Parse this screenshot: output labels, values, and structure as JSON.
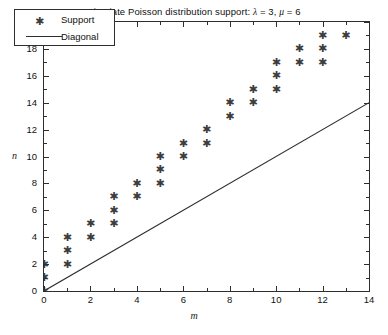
{
  "chart_data": {
    "type": "scatter",
    "title": "Bivariate Poisson distribution support: λ = 3, μ = 6",
    "title_parts": {
      "prefix": "Bivariate Poisson distribution support: ",
      "lambda_symbol": "λ",
      "lambda_eq": " = 3, ",
      "mu_symbol": "μ",
      "mu_eq": " = 6"
    },
    "xlabel": "m",
    "ylabel": "n",
    "xlim": [
      0,
      14
    ],
    "ylim": [
      0,
      20
    ],
    "xticks": [
      0,
      2,
      4,
      6,
      8,
      10,
      12,
      14
    ],
    "yticks": [
      0,
      2,
      4,
      6,
      8,
      10,
      12,
      14,
      16,
      18,
      20
    ],
    "xtick_minor_step": 1,
    "ytick_minor_step": 1,
    "grid": false,
    "legend_position": "upper left",
    "legend": [
      {
        "label": "Support",
        "marker": "asterisk-marker",
        "style": "marker"
      },
      {
        "label": "Diagonal",
        "marker": "line-segment",
        "style": "line"
      }
    ],
    "series": [
      {
        "name": "Support",
        "type": "scatter",
        "marker": "*",
        "color": "#3d3d3d",
        "points": [
          [
            0,
            0
          ],
          [
            0,
            1
          ],
          [
            0,
            2
          ],
          [
            1,
            2
          ],
          [
            1,
            3
          ],
          [
            1,
            4
          ],
          [
            2,
            4
          ],
          [
            2,
            5
          ],
          [
            3,
            5
          ],
          [
            3,
            6
          ],
          [
            3,
            7
          ],
          [
            4,
            7
          ],
          [
            4,
            8
          ],
          [
            5,
            8
          ],
          [
            5,
            9
          ],
          [
            5,
            10
          ],
          [
            6,
            10
          ],
          [
            6,
            11
          ],
          [
            7,
            11
          ],
          [
            7,
            12
          ],
          [
            8,
            13
          ],
          [
            8,
            14
          ],
          [
            9,
            14
          ],
          [
            9,
            15
          ],
          [
            10,
            15
          ],
          [
            10,
            16
          ],
          [
            10,
            17
          ],
          [
            11,
            17
          ],
          [
            11,
            18
          ],
          [
            12,
            17
          ],
          [
            12,
            18
          ],
          [
            12,
            19
          ],
          [
            13,
            19
          ]
        ]
      },
      {
        "name": "Diagonal",
        "type": "line",
        "color": "#2e2e2e",
        "x": [
          0,
          14
        ],
        "y": [
          0,
          14
        ]
      }
    ]
  }
}
